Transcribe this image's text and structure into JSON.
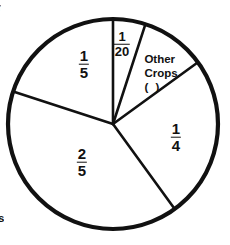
{
  "figure": {
    "background_color": "#ffffff",
    "stroke_color": "#111111",
    "text_color": "#111111"
  },
  "edge_fragments": {
    "top_left": "r",
    "bottom_left": "s"
  },
  "labels": {
    "one_twentieth": {
      "numerator": "1",
      "denominator": "20"
    },
    "one_fifth": {
      "numerator": "1",
      "denominator": "5"
    },
    "two_fifths": {
      "numerator": "2",
      "denominator": "5"
    },
    "one_quarter": {
      "numerator": "1",
      "denominator": "4"
    },
    "other_crops": {
      "line1": "Other",
      "line2": "Crops",
      "line3": "(   )"
    }
  },
  "chart_data": {
    "type": "pie",
    "title": "",
    "center": {
      "x": 113,
      "y": 124
    },
    "radius": 105,
    "start_angle_deg": 0,
    "direction": "clockwise",
    "grid": false,
    "legend": "none",
    "labels_inside": true,
    "categories": [
      "1/20",
      "Other Crops ( )",
      "1/4",
      "2/5",
      "1/5"
    ],
    "values": [
      0.05,
      0.1,
      0.25,
      0.4,
      0.2
    ],
    "value_labels": [
      "1/20",
      "(   )",
      "1/4",
      "2/5",
      "1/5"
    ],
    "slices": [
      {
        "name": "one-twentieth",
        "label": "1/20",
        "fraction": "1/20",
        "value": 0.05,
        "angle_deg": 18,
        "start_deg": 0,
        "end_deg": 18,
        "label_x": 122,
        "label_y": 44
      },
      {
        "name": "other-crops",
        "label": "Other Crops (   )",
        "fraction": "",
        "value": 0.1,
        "angle_deg": 36,
        "start_deg": 18,
        "end_deg": 54,
        "label_x": 161,
        "label_y": 73
      },
      {
        "name": "one-quarter",
        "label": "1/4",
        "fraction": "1/4",
        "value": 0.25,
        "angle_deg": 90,
        "start_deg": 54,
        "end_deg": 144,
        "label_x": 176,
        "label_y": 137
      },
      {
        "name": "two-fifths",
        "label": "2/5",
        "fraction": "2/5",
        "value": 0.4,
        "angle_deg": 144,
        "start_deg": 144,
        "end_deg": 288,
        "label_x": 82,
        "label_y": 162
      },
      {
        "name": "one-fifth",
        "label": "1/5",
        "fraction": "1/5",
        "value": 0.2,
        "angle_deg": 72,
        "start_deg": 288,
        "end_deg": 360,
        "label_x": 84,
        "label_y": 64
      }
    ]
  }
}
